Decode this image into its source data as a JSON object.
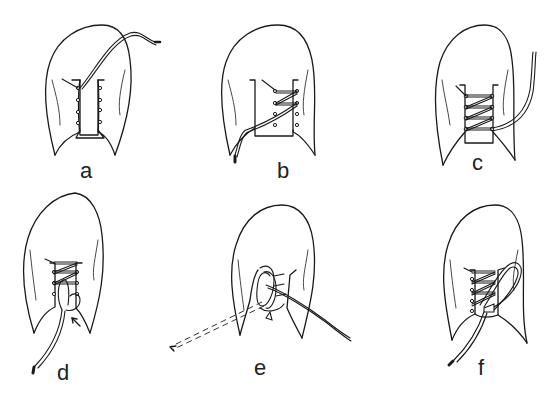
{
  "diagram": {
    "type": "shoe-lacing-sequence",
    "panels": [
      {
        "id": "a",
        "label": "a",
        "step": 1
      },
      {
        "id": "b",
        "label": "b",
        "step": 2
      },
      {
        "id": "c",
        "label": "c",
        "step": 3
      },
      {
        "id": "d",
        "label": "d",
        "step": 4
      },
      {
        "id": "e",
        "label": "e",
        "step": 5
      },
      {
        "id": "f",
        "label": "f",
        "step": 6
      }
    ]
  }
}
